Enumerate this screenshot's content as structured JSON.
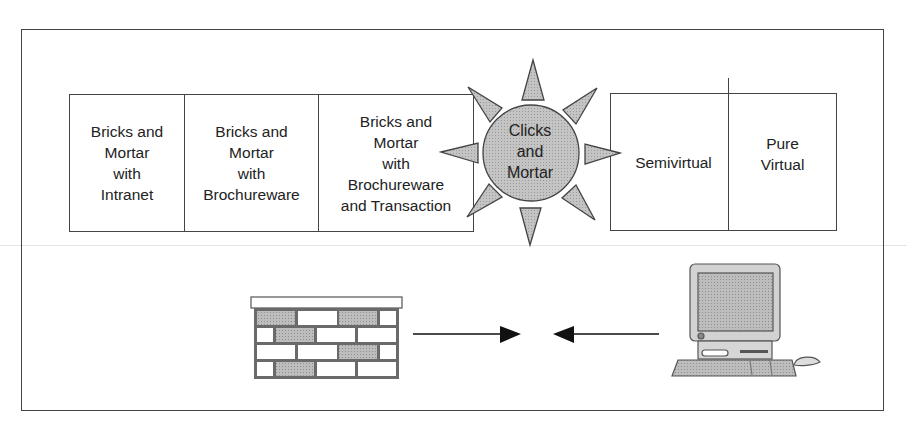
{
  "diagram": {
    "title": "",
    "left_group": {
      "cells": [
        {
          "label": "Bricks and\nMortar\nwith\nIntranet",
          "width": 115
        },
        {
          "label": "Bricks and\nMortar\nwith\nBrochureware",
          "width": 133
        },
        {
          "label": "Bricks and\nMortar\nwith\nBrochureware\nand Transaction",
          "width": 155
        }
      ]
    },
    "center": {
      "label": "Clicks\nand\nMortar",
      "shape": "sun-icon",
      "fill": "#c8c8c8"
    },
    "right_group": {
      "cells": [
        {
          "label": "Semivirtual",
          "width": 117
        },
        {
          "label": "Pure\nVirtual",
          "width": 108
        }
      ]
    },
    "bottom": {
      "left_icon": "brick-wall-icon",
      "right_icon": "computer-icon",
      "arrows": [
        "arrow-right-icon",
        "arrow-left-icon"
      ]
    },
    "colors": {
      "stroke": "#444444",
      "fill_gray": "#c8c8c8",
      "background": "#ffffff"
    }
  }
}
